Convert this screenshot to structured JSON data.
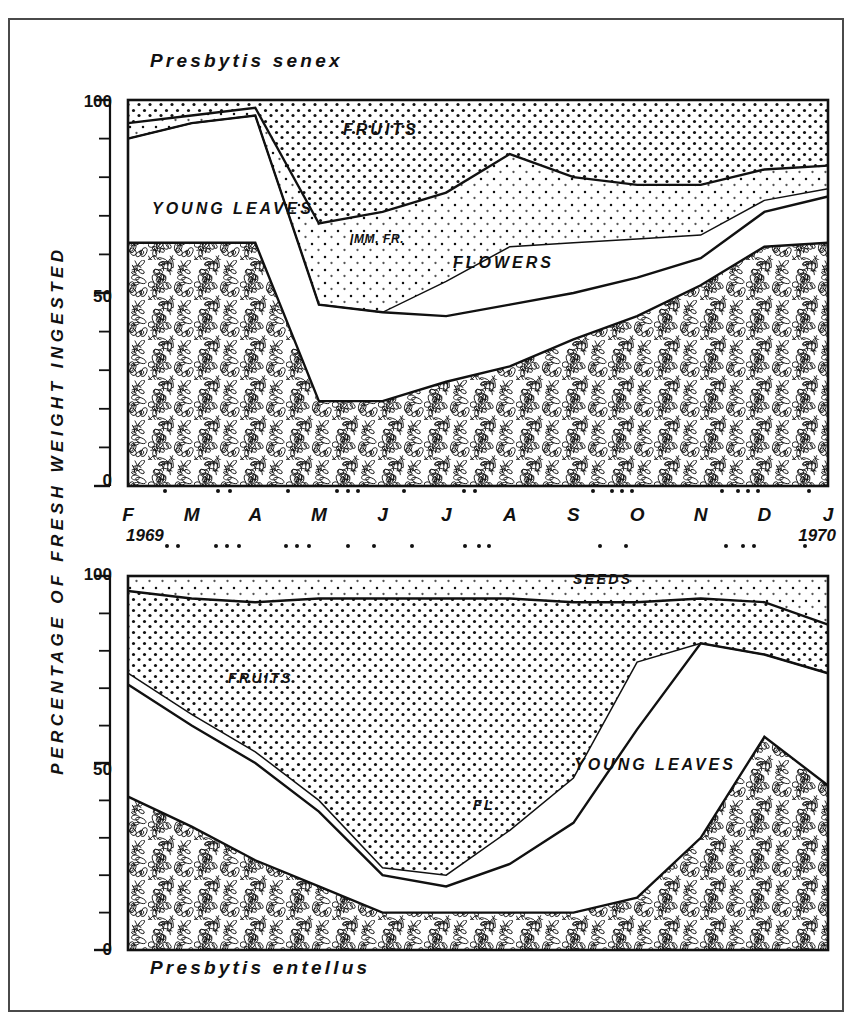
{
  "figure": {
    "y_axis_title": "PERCENTAGE OF FRESH WEIGHT INGESTED",
    "top_species": "Presbytis senex",
    "bottom_species": "Presbytis entellus",
    "year_start": "1969",
    "year_end": "1970",
    "months": [
      "F",
      "M",
      "A",
      "M",
      "J",
      "J",
      "A",
      "S",
      "O",
      "N",
      "D",
      "J"
    ],
    "y_ticks_labeled": [
      "0",
      "50",
      "100"
    ],
    "frame_color": "#4a4a4a",
    "ink_color": "#111111"
  },
  "labels": {
    "top": {
      "young_leaves": "YOUNG LEAVES",
      "fruits": "FRUITS",
      "imm_fr": "IMM. FR.",
      "flowers": "FLOWERS"
    },
    "bottom": {
      "fruits": "FRUITS",
      "seeds": "SEEDS",
      "young_leaves": "YOUNG LEAVES",
      "fl": "FL."
    }
  },
  "chart_data": [
    {
      "type": "area",
      "title": "Presbytis senex",
      "subtitle": "",
      "xlabel": "",
      "ylabel": "PERCENTAGE OF FRESH WEIGHT INGESTED",
      "ylim": [
        0,
        100
      ],
      "yticks": [
        0,
        10,
        20,
        30,
        40,
        50,
        60,
        70,
        80,
        90,
        100
      ],
      "ytick_labels": [
        "0",
        "",
        "",
        "",
        "",
        "50",
        "",
        "",
        "",
        "",
        "100"
      ],
      "grid": true,
      "legend": "inline-area-labels",
      "x": [
        "F",
        "M",
        "A",
        "M",
        "J",
        "J",
        "A",
        "S",
        "O",
        "N",
        "D",
        "J"
      ],
      "stacked": true,
      "stack_order_bottom_to_top": [
        "MATURE LEAVES",
        "YOUNG LEAVES",
        "FLOWERS",
        "IMM. FR.",
        "FRUITS"
      ],
      "series": [
        {
          "name": "MATURE LEAVES",
          "fill": "leaf-hatch",
          "values": [
            63,
            63,
            63,
            22,
            22,
            27,
            31,
            38,
            44,
            52,
            62,
            63
          ]
        },
        {
          "name": "YOUNG LEAVES",
          "fill": "white",
          "values": [
            27,
            31,
            33,
            25,
            23,
            17,
            16,
            12,
            10,
            7,
            9,
            12
          ]
        },
        {
          "name": "FLOWERS",
          "fill": "white",
          "values": [
            0,
            0,
            0,
            0,
            0,
            9,
            15,
            13,
            10,
            6,
            3,
            2
          ]
        },
        {
          "name": "IMM. FR.",
          "fill": "dots-light",
          "values": [
            4,
            2,
            2,
            21,
            26,
            23,
            24,
            17,
            14,
            13,
            8,
            6
          ]
        },
        {
          "name": "FRUITS",
          "fill": "dots-dense",
          "values": [
            6,
            4,
            2,
            32,
            29,
            24,
            14,
            20,
            22,
            22,
            18,
            17
          ]
        }
      ],
      "cumulative_boundaries": {
        "mature_leaves_top": [
          63,
          63,
          63,
          22,
          22,
          27,
          31,
          38,
          44,
          52,
          62,
          63
        ],
        "young_leaves_top": [
          90,
          94,
          96,
          47,
          45,
          44,
          47,
          50,
          54,
          59,
          71,
          75
        ],
        "flowers_top": [
          90,
          94,
          96,
          47,
          45,
          53,
          62,
          63,
          64,
          65,
          74,
          77
        ],
        "imm_fr_top": [
          94,
          96,
          98,
          68,
          71,
          76,
          86,
          80,
          78,
          78,
          82,
          83
        ],
        "fruits_top": [
          100,
          100,
          100,
          100,
          100,
          100,
          100,
          100,
          100,
          100,
          100,
          100
        ]
      }
    },
    {
      "type": "area",
      "title": "Presbytis entellus",
      "subtitle": "",
      "xlabel": "",
      "ylabel": "PERCENTAGE OF FRESH WEIGHT INGESTED",
      "ylim": [
        0,
        100
      ],
      "yticks": [
        0,
        10,
        20,
        30,
        40,
        50,
        60,
        70,
        80,
        90,
        100
      ],
      "ytick_labels": [
        "0",
        "",
        "",
        "",
        "",
        "50",
        "",
        "",
        "",
        "",
        "100"
      ],
      "grid": true,
      "legend": "inline-area-labels",
      "x": [
        "F",
        "M",
        "A",
        "M",
        "J",
        "J",
        "A",
        "S",
        "O",
        "N",
        "D",
        "J"
      ],
      "stacked": true,
      "stack_order_bottom_to_top": [
        "MATURE LEAVES",
        "YOUNG LEAVES",
        "FL.",
        "FRUITS",
        "SEEDS"
      ],
      "series": [
        {
          "name": "MATURE LEAVES",
          "fill": "leaf-hatch",
          "values": [
            41,
            33,
            24,
            17,
            10,
            10,
            10,
            10,
            14,
            30,
            57,
            44
          ]
        },
        {
          "name": "YOUNG LEAVES",
          "fill": "white",
          "values": [
            30,
            27,
            26,
            20,
            10,
            7,
            13,
            24,
            45,
            52,
            22,
            30
          ]
        },
        {
          "name": "FL.",
          "fill": "white",
          "values": [
            3,
            3,
            3,
            3,
            2,
            3,
            9,
            12,
            18,
            0,
            0,
            0
          ]
        },
        {
          "name": "FRUITS",
          "fill": "dots-dense",
          "values": [
            22,
            31,
            40,
            54,
            72,
            74,
            62,
            47,
            16,
            12,
            14,
            13
          ]
        },
        {
          "name": "SEEDS",
          "fill": "dots-light",
          "values": [
            4,
            6,
            7,
            6,
            6,
            6,
            6,
            7,
            7,
            6,
            7,
            13
          ]
        }
      ],
      "cumulative_boundaries": {
        "mature_leaves_top": [
          41,
          33,
          24,
          17,
          10,
          10,
          10,
          10,
          14,
          30,
          57,
          44
        ],
        "young_leaves_top": [
          71,
          60,
          50,
          37,
          20,
          17,
          23,
          34,
          59,
          82,
          79,
          74
        ],
        "fl_top": [
          74,
          63,
          53,
          40,
          22,
          20,
          32,
          46,
          77,
          82,
          79,
          74
        ],
        "fruits_top": [
          96,
          94,
          93,
          94,
          94,
          94,
          94,
          93,
          93,
          94,
          93,
          87
        ],
        "seeds_top": [
          100,
          100,
          100,
          100,
          100,
          100,
          100,
          100,
          100,
          100,
          100,
          100
        ]
      }
    }
  ],
  "phenology_dots": {
    "upper_row_month_offsets": [
      0.58,
      1.42,
      1.6,
      2.52,
      3.28,
      3.46,
      3.62,
      4.34,
      5.28,
      5.46,
      7.3,
      7.6,
      7.76,
      7.92,
      9.34,
      9.58,
      9.74,
      9.9,
      10.7
    ],
    "lower_row_month_offsets": [
      0.62,
      0.78,
      1.38,
      1.56,
      1.74,
      2.48,
      2.66,
      2.84,
      3.46,
      3.86,
      4.46,
      5.3,
      5.52,
      5.68,
      7.42,
      7.82,
      9.4,
      9.66,
      9.84,
      10.64
    ]
  }
}
